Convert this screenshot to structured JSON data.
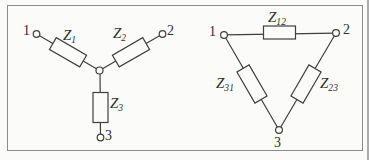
{
  "figure": {
    "background": "#fbfbf9",
    "frame_color": "#8c8c8c",
    "line_color": "#3f3f3f",
    "text_color": "#2e2e2e"
  },
  "wye": {
    "terminals": [
      {
        "label": "1"
      },
      {
        "label": "2"
      },
      {
        "label": "3"
      }
    ],
    "impedances": [
      {
        "main": "Z",
        "sub": "1"
      },
      {
        "main": "Z",
        "sub": "2"
      },
      {
        "main": "Z",
        "sub": "3"
      }
    ]
  },
  "delta": {
    "terminals": [
      {
        "label": "1"
      },
      {
        "label": "2"
      },
      {
        "label": "3"
      }
    ],
    "impedances": [
      {
        "main": "Z",
        "sub": "12"
      },
      {
        "main": "Z",
        "sub": "23"
      },
      {
        "main": "Z",
        "sub": "31"
      }
    ]
  }
}
